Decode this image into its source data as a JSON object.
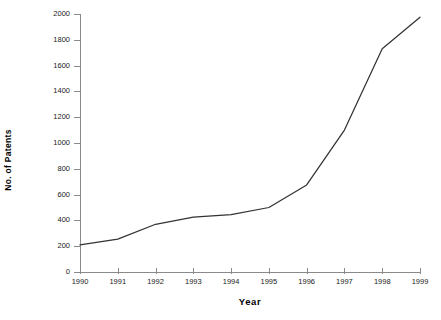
{
  "chart_data": {
    "type": "line",
    "title": "",
    "xlabel": "Year",
    "ylabel": "No. of Patents",
    "categories": [
      "1990",
      "1991",
      "1992",
      "1993",
      "1994",
      "1995",
      "1996",
      "1997",
      "1998",
      "1999"
    ],
    "x": [
      1990,
      1991,
      1992,
      1993,
      1994,
      1995,
      1996,
      1997,
      1998,
      1999
    ],
    "values": [
      210,
      255,
      370,
      425,
      445,
      500,
      675,
      1100,
      1730,
      1975
    ],
    "series": [
      {
        "name": "No. of Patents",
        "values": [
          210,
          255,
          370,
          425,
          445,
          500,
          675,
          1100,
          1730,
          1975
        ]
      }
    ],
    "ylim": [
      0,
      2000
    ],
    "y_ticks": [
      0,
      200,
      400,
      600,
      800,
      1000,
      1200,
      1400,
      1600,
      1800,
      2000
    ],
    "y_tick_labels": [
      "0",
      "200",
      "400",
      "600",
      "800",
      "1000",
      "1200",
      "1400",
      "1600",
      "1800",
      "2000"
    ],
    "xlim": [
      1990,
      1999
    ],
    "grid": false,
    "legend": false,
    "legend_position": "none",
    "line_color": "#333333",
    "background_color": "#ffffff",
    "axis_color": "#8a8a8a",
    "markers": false
  }
}
